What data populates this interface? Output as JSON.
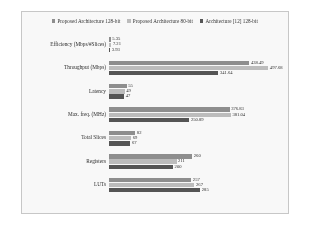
{
  "chart_data": {
    "type": "bar",
    "orientation": "horizontal",
    "title": "",
    "xlabel": "",
    "ylabel": "",
    "grid": false,
    "legend_position": "top",
    "xlim": [
      0,
      500
    ],
    "categories": [
      "Efficiency (Mbps/#Slices)",
      "Throughput (Mbps)",
      "Latency",
      "Max. freq. (MHz)",
      "Total Slices",
      "Registers",
      "LUTs"
    ],
    "series": [
      {
        "name": "Proposed Architecture 128-bit",
        "color": "#8c8c8c",
        "values": [
          5.35,
          438.49,
          55,
          376.83,
          82,
          260,
          257
        ],
        "labels": [
          "5.35",
          "438.49",
          "55",
          "376.83",
          "82",
          "260",
          "257"
        ]
      },
      {
        "name": "Proposed Architecture 80-bit",
        "color": "#bdbdbd",
        "values": [
          7.21,
          497.68,
          49,
          381.04,
          69,
          211,
          267
        ],
        "labels": [
          "7.21",
          "497.68",
          "49",
          "381.04",
          "69",
          "211",
          "267"
        ]
      },
      {
        "name": "Architecture [12] 128-bit",
        "color": "#4f4f4f",
        "values": [
          3.93,
          341.64,
          47,
          250.89,
          67,
          200,
          285
        ],
        "labels": [
          "3.93",
          "341.64",
          "47",
          "250.89",
          "67",
          "200",
          "285"
        ]
      }
    ]
  }
}
